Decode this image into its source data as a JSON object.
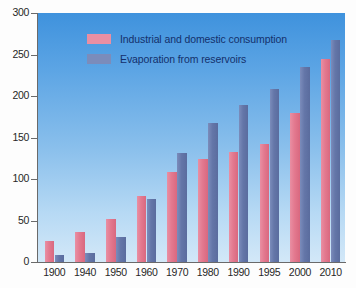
{
  "chart_data": {
    "type": "bar",
    "title": "",
    "xlabel": "",
    "ylabel": "",
    "ylim": [
      0,
      300
    ],
    "yticks": [
      0,
      50,
      100,
      150,
      200,
      250,
      300
    ],
    "grid": false,
    "legend_position": "top-left",
    "categories": [
      "1900",
      "1940",
      "1950",
      "1960",
      "1970",
      "1980",
      "1990",
      "1995",
      "2000",
      "2010"
    ],
    "series": [
      {
        "name": "Industrial and domestic consumption",
        "color": "#e3798f",
        "values": [
          25,
          36,
          52,
          79,
          109,
          124,
          132,
          142,
          179,
          245
        ]
      },
      {
        "name": "Evaporation from reservoirs",
        "color": "#6476a8",
        "values": [
          8,
          11,
          30,
          76,
          131,
          168,
          189,
          209,
          235,
          268
        ]
      }
    ]
  },
  "legend": {
    "items": [
      {
        "label": "Industrial and domestic consumption",
        "swatch": "pink-swatch"
      },
      {
        "label": "Evaporation from reservoirs",
        "swatch": "blue-swatch"
      }
    ]
  },
  "axes": {
    "y_tick_labels": [
      "300",
      "250",
      "200",
      "150",
      "100",
      "50",
      "0"
    ],
    "x_tick_labels": [
      "1900",
      "1940",
      "1950",
      "1960",
      "1970",
      "1980",
      "1990",
      "1995",
      "2000",
      "2010"
    ]
  },
  "colors": {
    "series_a": "#e3798f",
    "series_b": "#6476a8",
    "plot_background_top": "#3f92dd",
    "plot_background_bottom": "#d3e8f8",
    "axis": "#6a6a6a",
    "label_text": "#272727",
    "legend_text": "#14306b"
  }
}
